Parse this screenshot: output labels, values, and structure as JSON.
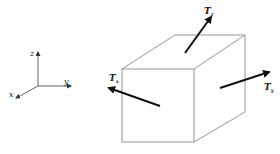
{
  "diagram": {
    "axes": {
      "z_label": "z",
      "y_label": "y",
      "x_label": "x"
    },
    "cube": {
      "traction_top": {
        "symbol": "T",
        "subscript": "z"
      },
      "traction_right": {
        "symbol": "T",
        "subscript": "y"
      },
      "traction_left": {
        "symbol": "T",
        "subscript": "x"
      }
    },
    "colors": {
      "edge": "#8a8a8a",
      "arrow": "#111111",
      "axis": "#666666"
    }
  }
}
